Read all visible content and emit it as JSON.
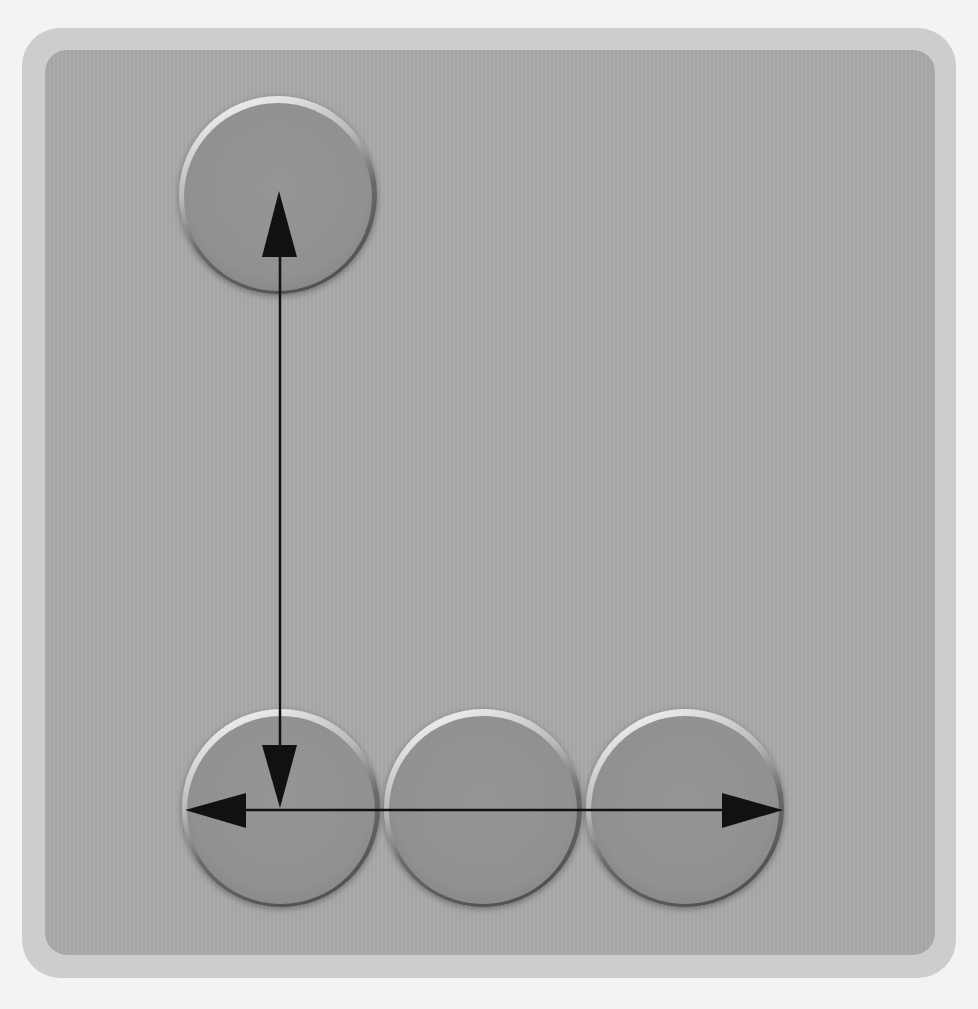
{
  "diagram": {
    "type": "movement-diagram",
    "colors": {
      "page_background": "#f3f3f3",
      "outer_frame": "#cdcdcd",
      "inner_panel": "#a8a8a8",
      "circle_fill": "#939393",
      "circle_rim_dark": "#5e5e5e",
      "circle_highlight": "#e4e4e4",
      "arrow": "#111111"
    },
    "circles": [
      {
        "id": "top",
        "cx": 278,
        "cy": 195,
        "r": 99
      },
      {
        "id": "bottom-left",
        "cx": 281,
        "cy": 808,
        "r": 99
      },
      {
        "id": "bottom-middle",
        "cx": 483,
        "cy": 808,
        "r": 99
      },
      {
        "id": "bottom-right",
        "cx": 685,
        "cy": 808,
        "r": 99
      }
    ],
    "arrows": [
      {
        "id": "vertical",
        "from": "top",
        "to": "bottom-left",
        "heads": "both",
        "x": 280,
        "y1": 192,
        "y2": 808
      },
      {
        "id": "horizontal",
        "from": "bottom-left",
        "to": "bottom-right",
        "heads": "both",
        "y": 810,
        "x1": 185,
        "x2": 783
      }
    ]
  }
}
